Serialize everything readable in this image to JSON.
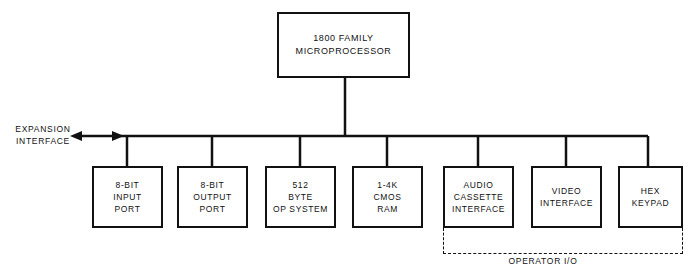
{
  "diagram": {
    "title_block": {
      "id": "cpu",
      "label": "1800 FAMILY\nMICROPROCESSOR"
    },
    "bus": {
      "expansion_label": "EXPANSION\nINTERFACE",
      "arrow_direction": "left"
    },
    "group": {
      "label": "OPERATOR I/O",
      "style": "dashed",
      "members": [
        "audio-cassette-interface",
        "video-interface",
        "hex-keypad"
      ]
    },
    "peripherals": [
      {
        "id": "input-port",
        "label": "8-BIT\nINPUT\nPORT",
        "x": 92,
        "width": 71
      },
      {
        "id": "output-port",
        "label": "8-BIT\nOUTPUT\nPORT",
        "x": 177,
        "width": 71
      },
      {
        "id": "op-system",
        "label": "512\nBYTE\nOP SYSTEM",
        "x": 265,
        "width": 71
      },
      {
        "id": "cmos-ram",
        "label": "1-4K\nCMOS\nRAM",
        "x": 352,
        "width": 71
      },
      {
        "id": "audio-cassette-interface",
        "label": "AUDIO\nCASSETTE\nINTERFACE",
        "x": 443,
        "width": 71
      },
      {
        "id": "video-interface",
        "label": "VIDEO\nINTERFACE",
        "x": 531,
        "width": 71
      },
      {
        "id": "hex-keypad",
        "label": "HEX\nKEYPAD",
        "x": 618,
        "width": 65
      }
    ],
    "colors": {
      "line": "#111111",
      "background": "#ffffff"
    }
  }
}
